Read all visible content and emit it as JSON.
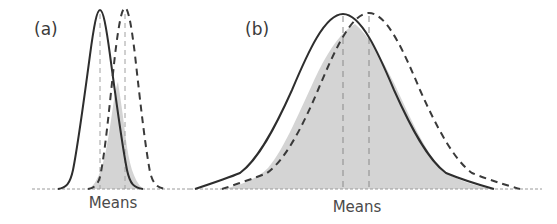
{
  "figure": {
    "type": "diagram",
    "colors": {
      "solid_curve": "#2e2e2e",
      "dashed_curve": "#3a3a3a",
      "overlap_fill": "#d4d4d4",
      "mean_line": "#9a9a9a",
      "baseline": "#9a9a9a"
    },
    "panels": [
      {
        "id": "a",
        "label": "(a)",
        "xlabel": "Means",
        "curves": [
          {
            "style": "solid",
            "mean_x": 100,
            "peak_y": 10,
            "spread": "narrow"
          },
          {
            "style": "dashed",
            "mean_x": 125,
            "peak_y": 8,
            "spread": "narrow"
          }
        ],
        "overlap_shaded": true
      },
      {
        "id": "b",
        "label": "(b)",
        "xlabel": "Means",
        "curves": [
          {
            "style": "solid",
            "mean_x": 343,
            "peak_y": 14,
            "spread": "wide"
          },
          {
            "style": "dashed",
            "mean_x": 369,
            "peak_y": 13,
            "spread": "wide"
          }
        ],
        "overlap_shaded": true
      }
    ]
  }
}
